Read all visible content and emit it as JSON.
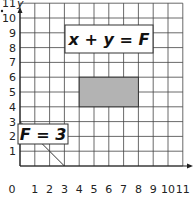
{
  "diagram": {
    "type": "coordinate-grid",
    "x_axis": {
      "label": "",
      "ticks": [
        "0",
        "1",
        "2",
        "3",
        "4",
        "5",
        "6",
        "7",
        "8",
        "9",
        "10",
        "11"
      ],
      "range": [
        0,
        11
      ]
    },
    "y_axis": {
      "label": "y",
      "ticks": [
        "1",
        "2",
        "3",
        "4",
        "5",
        "6",
        "7",
        "8",
        "9",
        "10",
        "11"
      ],
      "range": [
        0,
        11
      ]
    },
    "grid": true,
    "shaded_rectangle": {
      "x0": 4,
      "x1": 8,
      "y0": 4,
      "y1": 6,
      "color": "#b3b3b3"
    },
    "line": {
      "from": [
        0,
        3
      ],
      "to": [
        3,
        0
      ]
    },
    "labels": {
      "equation": "x + y = F",
      "value": "F = 3"
    }
  }
}
